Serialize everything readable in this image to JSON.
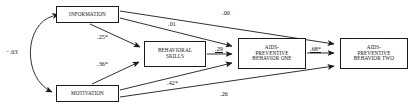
{
  "diagram": {
    "type": "path-diagram",
    "title": "",
    "nodes": [
      {
        "id": "information",
        "label": "INFORMATION"
      },
      {
        "id": "motivation",
        "label": "MOTIVATION"
      },
      {
        "id": "behavioral_skills",
        "label": "BEHAVIORAL\nSKILLS"
      },
      {
        "id": "behavior_one",
        "label": "AIDS-\nPREVENTIVE\nBEHAVIOR ONE"
      },
      {
        "id": "behavior_two",
        "label": "AIDS-\nPREVENTIVE\nBEHAVIOR TWO"
      }
    ],
    "paths": [
      {
        "id": "corr",
        "from": "information",
        "to": "motivation",
        "coefficient": "−.03",
        "significant": false,
        "underlined": false,
        "style": "curved-double-arrow"
      },
      {
        "id": "info_skills",
        "from": "information",
        "to": "behavioral_skills",
        "coefficient": ".25*",
        "significant": true,
        "underlined": false,
        "style": "straight"
      },
      {
        "id": "info_b1",
        "from": "information",
        "to": "behavior_one",
        "coefficient": ".01",
        "significant": false,
        "underlined": false,
        "style": "straight"
      },
      {
        "id": "info_b2",
        "from": "information",
        "to": "behavior_two",
        "coefficient": ".00",
        "significant": false,
        "underlined": false,
        "style": "straight"
      },
      {
        "id": "mot_skills",
        "from": "motivation",
        "to": "behavioral_skills",
        "coefficient": ".36*",
        "significant": true,
        "underlined": false,
        "style": "straight"
      },
      {
        "id": "mot_b1",
        "from": "motivation",
        "to": "behavior_one",
        "coefficient": ".42*",
        "significant": true,
        "underlined": false,
        "style": "straight"
      },
      {
        "id": "mot_b2",
        "from": "motivation",
        "to": "behavior_two",
        "coefficient": ".26",
        "significant": false,
        "underlined": false,
        "style": "straight"
      },
      {
        "id": "skills_b1",
        "from": "behavioral_skills",
        "to": "behavior_one",
        "coefficient": ".29",
        "significant": false,
        "underlined": true,
        "style": "straight"
      },
      {
        "id": "b1_b2",
        "from": "behavior_one",
        "to": "behavior_two",
        "coefficient": ".68*",
        "significant": true,
        "underlined": true,
        "style": "straight"
      }
    ],
    "colors": {
      "stroke": "#1a1a1a",
      "text": "#141414",
      "background": "#ffffff"
    }
  }
}
